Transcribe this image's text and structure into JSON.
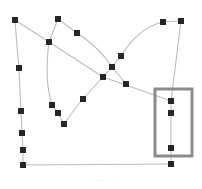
{
  "diagram": {
    "type": "node-link graph",
    "colors": {
      "background": "#ffffff",
      "edge": "#bdbdbd",
      "node": "#262626",
      "highlight_box": "#8c8c8c"
    },
    "node_size": 6,
    "nodes": [
      {
        "id": "A",
        "x": 15,
        "y": 20
      },
      {
        "id": "B",
        "x": 58,
        "y": 19
      },
      {
        "id": "C",
        "x": 49,
        "y": 42
      },
      {
        "id": "D",
        "x": 77,
        "y": 33
      },
      {
        "id": "E",
        "x": 19,
        "y": 68
      },
      {
        "id": "F",
        "x": 103,
        "y": 77
      },
      {
        "id": "G",
        "x": 163,
        "y": 22
      },
      {
        "id": "H",
        "x": 181,
        "y": 21
      },
      {
        "id": "I",
        "x": 121,
        "y": 56
      },
      {
        "id": "J",
        "x": 112,
        "y": 67
      },
      {
        "id": "K",
        "x": 126,
        "y": 84
      },
      {
        "id": "L",
        "x": 52,
        "y": 105
      },
      {
        "id": "M",
        "x": 58,
        "y": 113
      },
      {
        "id": "N",
        "x": 64,
        "y": 124
      },
      {
        "id": "O",
        "x": 83,
        "y": 99
      },
      {
        "id": "P",
        "x": 21,
        "y": 111
      },
      {
        "id": "Q",
        "x": 22,
        "y": 133
      },
      {
        "id": "R",
        "x": 23,
        "y": 150
      },
      {
        "id": "S",
        "x": 23,
        "y": 165
      },
      {
        "id": "T",
        "x": 171,
        "y": 101
      },
      {
        "id": "U",
        "x": 171,
        "y": 113
      },
      {
        "id": "V",
        "x": 171,
        "y": 148
      },
      {
        "id": "W",
        "x": 171,
        "y": 164
      }
    ],
    "edges": [
      {
        "path": "M15 20 L49 42"
      },
      {
        "path": "M49 42 L58 19"
      },
      {
        "path": "M58 19 L77 33"
      },
      {
        "path": "M15 20 Q18 60 19 68"
      },
      {
        "path": "M19 68 L21 111 L22 133 L23 150 L23 165"
      },
      {
        "path": "M49 42 L103 77"
      },
      {
        "path": "M77 33 Q100 48 112 67"
      },
      {
        "path": "M49 42 Q44 80 52 105"
      },
      {
        "path": "M52 105 L58 113 L64 124"
      },
      {
        "path": "M64 124 Q75 108 83 99"
      },
      {
        "path": "M83 99 L103 77"
      },
      {
        "path": "M103 77 L112 67 L121 56"
      },
      {
        "path": "M112 67 L126 84"
      },
      {
        "path": "M103 77 L171 101"
      },
      {
        "path": "M121 56 Q138 28 163 22"
      },
      {
        "path": "M163 22 L181 21"
      },
      {
        "path": "M181 21 L171 101"
      },
      {
        "path": "M171 101 L171 164"
      },
      {
        "path": "M23 165 L171 164"
      }
    ],
    "highlight_box": {
      "x": 155,
      "y": 89,
      "width": 37,
      "height": 67
    },
    "caption": "— — —"
  }
}
